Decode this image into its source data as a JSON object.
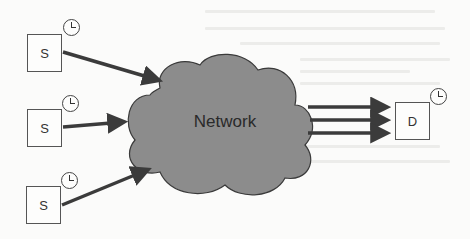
{
  "diagram": {
    "type": "network-topology",
    "cloud": {
      "label": "Network",
      "fill": "#8c8c8c",
      "stroke": "#3a3a3a"
    },
    "sources": [
      {
        "id": "s1",
        "label": "S",
        "has_clock": true
      },
      {
        "id": "s2",
        "label": "S",
        "has_clock": true
      },
      {
        "id": "s3",
        "label": "S",
        "has_clock": true
      }
    ],
    "destination": {
      "id": "d",
      "label": "D",
      "has_clock": true
    },
    "edges": [
      {
        "from": "s1",
        "to": "Network"
      },
      {
        "from": "s2",
        "to": "Network"
      },
      {
        "from": "s3",
        "to": "Network"
      },
      {
        "from": "Network",
        "to": "d"
      },
      {
        "from": "Network",
        "to": "d"
      },
      {
        "from": "Network",
        "to": "d"
      }
    ],
    "colors": {
      "arrow": "#3b3b3b",
      "background": "#fbfbfa",
      "box_border": "#555555"
    }
  }
}
